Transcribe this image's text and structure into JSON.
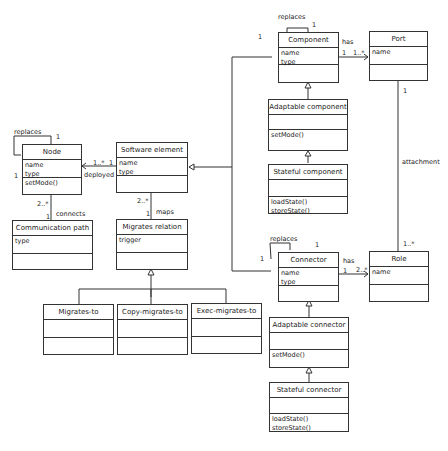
{
  "classes": {
    "component": {
      "name": "Component",
      "attrs": [
        "name",
        "type"
      ],
      "ops": []
    },
    "port": {
      "name": "Port",
      "attrs": [
        "name"
      ],
      "ops": []
    },
    "adaptable_component": {
      "name": "Adaptable component",
      "attrs": [],
      "ops": [
        "setMode()"
      ]
    },
    "stateful_component": {
      "name": "Stateful component",
      "attrs": [],
      "ops": [
        "loadState()",
        "storeState()"
      ]
    },
    "node": {
      "name": "Node",
      "attrs": [
        "name",
        "type"
      ],
      "ops": [
        "setMode()"
      ]
    },
    "software_element": {
      "name": "Software element",
      "attrs": [
        "name",
        "type"
      ],
      "ops": []
    },
    "communication_path": {
      "name": "Communication path",
      "attrs": [
        "type"
      ],
      "ops": []
    },
    "migrates_relation": {
      "name": "Migrates relation",
      "attrs": [
        "trigger"
      ],
      "ops": []
    },
    "migrates_to": {
      "name": "Migrates-to",
      "attrs": [],
      "ops": []
    },
    "copy_migrates_to": {
      "name": "Copy-migrates-to",
      "attrs": [],
      "ops": []
    },
    "exec_migrates_to": {
      "name": "Exec-migrates-to",
      "attrs": [],
      "ops": []
    },
    "connector": {
      "name": "Connector",
      "attrs": [
        "name",
        "type"
      ],
      "ops": []
    },
    "role": {
      "name": "Role",
      "attrs": [
        "name"
      ],
      "ops": []
    },
    "adaptable_connector": {
      "name": "Adaptable connector",
      "attrs": [],
      "ops": [
        "setMode()"
      ]
    },
    "stateful_connector": {
      "name": "Stateful connector",
      "attrs": [],
      "ops": [
        "loadState()",
        "storeState()"
      ]
    }
  },
  "labels": {
    "component_replaces": "replaces",
    "component_replaces_m1": "1",
    "component_replaces_m2": "1",
    "component_port_has": "has",
    "component_port_m1": "1",
    "component_port_m2": "1..*",
    "port_role_attachment": "attachment",
    "port_role_m1": "1",
    "port_role_m2": "1..*",
    "node_replaces": "replaces",
    "node_replaces_m1": "1",
    "node_replaces_m2": "1",
    "deployed": "deployed",
    "deployed_m1": "1..*",
    "deployed_m2": "1",
    "connects": "connects",
    "connects_m1": "2..*",
    "connects_m2": "1",
    "maps": "maps",
    "maps_m1": "2..*",
    "maps_m2": "1",
    "connector_replaces": "replaces",
    "connector_replaces_m1": "1",
    "connector_replaces_m2": "1",
    "connector_role_has": "has",
    "connector_role_m1": "1",
    "connector_role_m2": "2..*"
  }
}
